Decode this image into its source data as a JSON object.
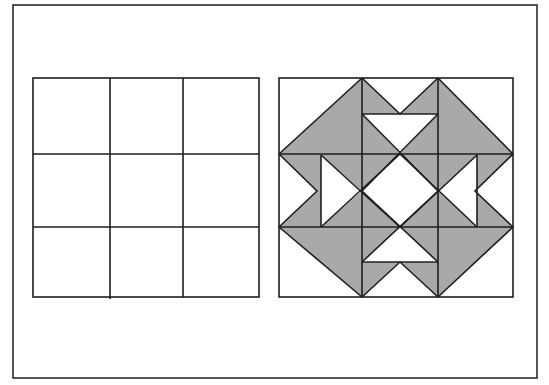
{
  "figure": {
    "colors": {
      "line": "#1e1e1e",
      "fill": "#a9a9a9",
      "background": "#ffffff"
    },
    "frame": {
      "x": 13,
      "y": 5,
      "width": 524,
      "height": 373
    },
    "left_panel": {
      "label": "3x3 grid",
      "rows": 3,
      "cols": 3,
      "x": 33,
      "y": 78,
      "width": 226,
      "height": 219,
      "vlines": [
        110,
        183
      ],
      "hlines": [
        154,
        227
      ]
    },
    "right_panel": {
      "label": "quilt block pattern",
      "x": 279,
      "y": 78,
      "width": 234,
      "height": 219,
      "vlines": [
        362,
        438
      ],
      "hlines": [
        154,
        227
      ]
    }
  }
}
